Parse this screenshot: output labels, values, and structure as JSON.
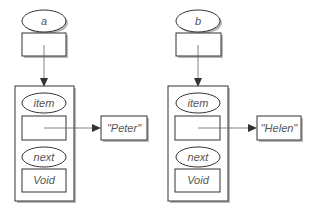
{
  "diagram": {
    "groups": [
      {
        "variable_name": "a",
        "node": {
          "item_label": "item",
          "next_label": "next",
          "next_value": "Void"
        },
        "item_value": "\"Peter\""
      },
      {
        "variable_name": "b",
        "node": {
          "item_label": "item",
          "next_label": "next",
          "next_value": "Void"
        },
        "item_value": "\"Helen\""
      }
    ]
  }
}
